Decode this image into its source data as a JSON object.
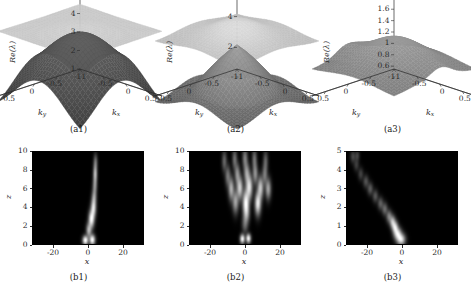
{
  "figure": {
    "panels": [
      {
        "id": "a1",
        "caption": "(a1)",
        "type": "surface3d",
        "zlabel": "Re(λ)",
        "xlabel": "k",
        "xlabel_sub": "x",
        "ylabel": "k",
        "ylabel_sub": "y",
        "zticks": [
          "1",
          "2",
          "3",
          "4",
          "5"
        ],
        "zvalues": [
          1,
          2,
          3,
          4,
          5
        ],
        "yticks": [
          "0.5",
          "0",
          "-0.5",
          "-1"
        ],
        "xticks": [
          "-1",
          "-0.5",
          "0",
          "0.5"
        ],
        "zlim": [
          1,
          5
        ],
        "klim": [
          -1,
          0.8
        ],
        "surfaces": [
          {
            "name": "upper-band",
            "shade": "light",
            "level": 4.55,
            "amp": 0.3,
            "mode": "flat-ripple"
          },
          {
            "name": "lower-band",
            "shade": "dark",
            "level": 2.95,
            "amp": 1.55,
            "mode": "saddle-dome"
          }
        ]
      },
      {
        "id": "a2",
        "caption": "(a2)",
        "type": "surface3d",
        "zlabel": "Re(λ)",
        "xlabel": "k",
        "xlabel_sub": "x",
        "ylabel": "k",
        "ylabel_sub": "y",
        "zticks": [
          "2",
          "4"
        ],
        "zvalues": [
          2,
          4
        ],
        "yticks": [
          "0.5",
          "0",
          "-0.5",
          "-1"
        ],
        "xticks": [
          "-1",
          "-0.5",
          "0",
          "0.5"
        ],
        "zlim": [
          0.6,
          5.4
        ],
        "klim": [
          -1,
          0.8
        ],
        "surfaces": [
          {
            "name": "upper-band",
            "shade": "light",
            "level": 4.45,
            "amp": 0.95,
            "mode": "peak-cross"
          },
          {
            "name": "lower-band",
            "shade": "mid",
            "level": 3.4,
            "amp": 2.6,
            "mode": "funnel"
          }
        ]
      },
      {
        "id": "a3",
        "caption": "(a3)",
        "type": "surface3d",
        "zlabel": "Re(λ)",
        "xlabel": "k",
        "xlabel_sub": "x",
        "ylabel": "k",
        "ylabel_sub": "y",
        "zticks": [
          "1.8",
          "1.6",
          "1.4",
          "1.2",
          "1",
          "0.8",
          "0.6"
        ],
        "zvalues": [
          1.8,
          1.6,
          1.4,
          1.2,
          1.0,
          0.8,
          0.6
        ],
        "yticks": [
          "0.5",
          "0",
          "-0.5",
          "-1"
        ],
        "xticks": [
          "-1",
          "-0.5",
          "0",
          "0.5"
        ],
        "zlim": [
          0.55,
          1.85
        ],
        "klim": [
          -1,
          0.8
        ],
        "surfaces": [
          {
            "name": "single-band",
            "shade": "mid",
            "level": 1.25,
            "amp": 0.6,
            "mode": "dome-lobes"
          }
        ]
      },
      {
        "id": "b1",
        "caption": "(b1)",
        "type": "density",
        "xlabel": "x",
        "ylabel": "z",
        "xticks": [
          "-20",
          "0",
          "20"
        ],
        "xvalues": [
          -20,
          0,
          20
        ],
        "yticks": [
          "0",
          "2",
          "4",
          "6",
          "8",
          "10"
        ],
        "yvalues": [
          0,
          2,
          4,
          6,
          8,
          10
        ],
        "xlim": [
          -32,
          32
        ],
        "ylim": [
          0,
          10
        ],
        "pattern": "single-filament",
        "spots": [
          {
            "x": -1.5,
            "z": 0.4,
            "sx": 1.5,
            "sz": 0.45,
            "i": 1.0
          },
          {
            "x": 2.5,
            "z": 0.45,
            "sx": 1.5,
            "sz": 0.5,
            "i": 1.0
          },
          {
            "x": 0.5,
            "z": 1.5,
            "sx": 1.4,
            "sz": 0.7,
            "i": 0.62
          },
          {
            "x": 2.0,
            "z": 2.7,
            "sx": 1.5,
            "sz": 0.85,
            "i": 0.95
          },
          {
            "x": 3.2,
            "z": 3.9,
            "sx": 1.4,
            "sz": 0.9,
            "i": 0.8
          },
          {
            "x": 3.6,
            "z": 5.1,
            "sx": 1.3,
            "sz": 0.8,
            "i": 0.45
          },
          {
            "x": 4.0,
            "z": 6.3,
            "sx": 1.2,
            "sz": 0.8,
            "i": 0.4
          },
          {
            "x": 4.2,
            "z": 7.6,
            "sx": 1.1,
            "sz": 0.9,
            "i": 0.62
          },
          {
            "x": 4.4,
            "z": 8.9,
            "sx": 1.1,
            "sz": 0.8,
            "i": 0.3
          }
        ]
      },
      {
        "id": "b2",
        "caption": "(b2)",
        "type": "density",
        "xlabel": "x",
        "ylabel": "z",
        "xticks": [
          "-20",
          "0",
          "20"
        ],
        "xvalues": [
          -20,
          0,
          20
        ],
        "yticks": [
          "0",
          "2",
          "4",
          "6",
          "8",
          "10"
        ],
        "yvalues": [
          0,
          2,
          4,
          6,
          8,
          10
        ],
        "xlim": [
          -32,
          32
        ],
        "ylim": [
          0,
          10
        ],
        "pattern": "multi-filament-fan",
        "spots": [
          {
            "x": -1.5,
            "z": 0.55,
            "sx": 1.3,
            "sz": 0.45,
            "i": 0.95
          },
          {
            "x": 2.0,
            "z": 0.6,
            "sx": 1.3,
            "sz": 0.45,
            "i": 0.95
          },
          {
            "x": 0.0,
            "z": 2.2,
            "sx": 1.6,
            "sz": 0.9,
            "i": 0.3
          },
          {
            "x": 1.0,
            "z": 3.3,
            "sx": 1.6,
            "sz": 0.9,
            "i": 0.4
          },
          {
            "x": -5.5,
            "z": 4.6,
            "sx": 1.6,
            "sz": 1.1,
            "i": 0.55
          },
          {
            "x": 0.5,
            "z": 4.5,
            "sx": 1.7,
            "sz": 1.2,
            "i": 0.95
          },
          {
            "x": 7.5,
            "z": 4.4,
            "sx": 1.6,
            "sz": 1.1,
            "i": 0.9
          },
          {
            "x": -8.0,
            "z": 6.0,
            "sx": 1.5,
            "sz": 1.1,
            "i": 0.6
          },
          {
            "x": -3.0,
            "z": 6.1,
            "sx": 1.6,
            "sz": 1.1,
            "i": 0.75
          },
          {
            "x": 2.5,
            "z": 6.2,
            "sx": 1.7,
            "sz": 1.2,
            "i": 0.85
          },
          {
            "x": 9.0,
            "z": 6.1,
            "sx": 1.6,
            "sz": 1.1,
            "i": 0.7
          },
          {
            "x": 13.5,
            "z": 6.0,
            "sx": 1.5,
            "sz": 1.0,
            "i": 0.55
          },
          {
            "x": -10.0,
            "z": 7.4,
            "sx": 1.4,
            "sz": 1.0,
            "i": 0.35
          },
          {
            "x": -4.5,
            "z": 7.6,
            "sx": 1.4,
            "sz": 1.0,
            "i": 0.45
          },
          {
            "x": 1.0,
            "z": 7.7,
            "sx": 1.5,
            "sz": 1.0,
            "i": 0.5
          },
          {
            "x": 6.0,
            "z": 7.6,
            "sx": 1.4,
            "sz": 1.0,
            "i": 0.45
          },
          {
            "x": 11.5,
            "z": 7.5,
            "sx": 1.4,
            "sz": 1.0,
            "i": 0.35
          },
          {
            "x": -12.0,
            "z": 9.0,
            "sx": 1.3,
            "sz": 1.0,
            "i": 0.28
          },
          {
            "x": -6.0,
            "z": 9.2,
            "sx": 1.3,
            "sz": 1.0,
            "i": 0.32
          },
          {
            "x": 0.0,
            "z": 9.3,
            "sx": 1.4,
            "sz": 1.0,
            "i": 0.38
          },
          {
            "x": 5.5,
            "z": 9.2,
            "sx": 1.3,
            "sz": 1.0,
            "i": 0.32
          },
          {
            "x": 12.0,
            "z": 9.0,
            "sx": 1.3,
            "sz": 1.0,
            "i": 0.26
          }
        ]
      },
      {
        "id": "b3",
        "caption": "(b3)",
        "type": "density",
        "xlabel": "x",
        "ylabel": "z",
        "xticks": [
          "-20",
          "0",
          "20"
        ],
        "xvalues": [
          -20,
          0,
          20
        ],
        "yticks": [
          "0",
          "1",
          "2",
          "3",
          "4",
          "5"
        ],
        "yvalues": [
          0,
          1,
          2,
          3,
          4,
          5
        ],
        "xlim": [
          -32,
          32
        ],
        "ylim": [
          0,
          5
        ],
        "pattern": "diagonal-streak",
        "spots": [
          {
            "x": -0.5,
            "z": 0.25,
            "sx": 2.2,
            "sz": 0.28,
            "i": 1.0
          },
          {
            "x": -2.5,
            "z": 0.55,
            "sx": 2.0,
            "sz": 0.3,
            "i": 0.95
          },
          {
            "x": -4.0,
            "z": 0.9,
            "sx": 1.6,
            "sz": 0.3,
            "i": 0.9
          },
          {
            "x": -5.5,
            "z": 1.2,
            "sx": 1.5,
            "sz": 0.3,
            "i": 0.75
          },
          {
            "x": -7.5,
            "z": 1.5,
            "sx": 1.5,
            "sz": 0.3,
            "i": 0.45
          },
          {
            "x": -10.0,
            "z": 1.9,
            "sx": 1.5,
            "sz": 0.3,
            "i": 0.35
          },
          {
            "x": -12.5,
            "z": 2.2,
            "sx": 1.5,
            "sz": 0.3,
            "i": 0.3
          },
          {
            "x": -15.5,
            "z": 2.6,
            "sx": 1.5,
            "sz": 0.3,
            "i": 0.26
          },
          {
            "x": -18.5,
            "z": 3.0,
            "sx": 1.5,
            "sz": 0.3,
            "i": 0.28
          },
          {
            "x": -21.0,
            "z": 3.4,
            "sx": 1.5,
            "sz": 0.3,
            "i": 0.24
          },
          {
            "x": -24.0,
            "z": 3.8,
            "sx": 1.4,
            "sz": 0.3,
            "i": 0.18
          },
          {
            "x": -26.5,
            "z": 4.3,
            "sx": 1.4,
            "sz": 0.3,
            "i": 0.16
          },
          {
            "x": -28.5,
            "z": 4.75,
            "sx": 1.4,
            "sz": 0.3,
            "i": 0.2
          },
          {
            "x": -26.0,
            "z": 4.8,
            "sx": 1.2,
            "sz": 0.25,
            "i": 0.18
          }
        ]
      }
    ]
  },
  "colors": {
    "background": "#ffffff",
    "axis": "#2b2b2b",
    "surface_light": "#c9c9c9",
    "surface_mid": "#a8a8a8",
    "surface_dark": "#5a5a5a",
    "density_bg": "#000000",
    "density_hot": "#ffffff"
  }
}
